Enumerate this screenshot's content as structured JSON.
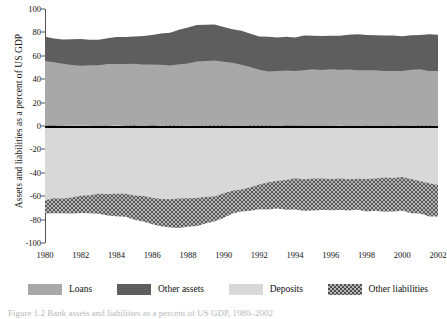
{
  "figure": {
    "caption": "Figure 1.2  Bank assets and liabilities as a percent of US GDP, 1980–2002"
  },
  "axes": {
    "ylabel": "Assets and liabilities as a percent of US GDP",
    "yticks": [
      100,
      80,
      60,
      40,
      20,
      0,
      -20,
      -40,
      -60,
      -80,
      -100
    ],
    "ytick_labels": [
      "100",
      "80",
      "60",
      "40",
      "20",
      "0",
      "-20",
      "-40",
      "-60",
      "-80",
      "-100"
    ],
    "xticks": [
      1980,
      1982,
      1984,
      1986,
      1988,
      1990,
      1992,
      1994,
      1996,
      1998,
      2000,
      2002
    ],
    "xtick_labels": [
      "1980",
      "1982",
      "1984",
      "1986",
      "1988",
      "1990",
      "1992",
      "1994",
      "1996",
      "1998",
      "2000",
      "2002"
    ]
  },
  "legend": [
    {
      "label": "Loans",
      "key": "loans",
      "color": "#a8a8a8",
      "pattern": "solid"
    },
    {
      "label": "Other assets",
      "key": "other_assets",
      "color": "#5e5e5e",
      "pattern": "solid"
    },
    {
      "label": "Deposits",
      "key": "deposits",
      "color": "#d8d8d8",
      "pattern": "solid"
    },
    {
      "label": "Other liabilities",
      "key": "other_liabilities",
      "color": "#9a9a9a",
      "pattern": "dots"
    }
  ],
  "chart_data": {
    "type": "area",
    "title": "",
    "xlabel": "",
    "ylabel": "Assets and liabilities as a percent of US GDP",
    "xlim": [
      1980,
      2002
    ],
    "ylim": [
      -100,
      100
    ],
    "grid": false,
    "legend_position": "bottom",
    "stacked": true,
    "note": "Assets plotted as positive stacked areas (Loans then Other assets); liabilities plotted as negative stacked areas (Deposits then Other liabilities).",
    "x": [
      1980,
      1980.5,
      1981,
      1981.5,
      1982,
      1982.5,
      1983,
      1983.5,
      1984,
      1984.5,
      1985,
      1985.5,
      1986,
      1986.5,
      1987,
      1987.5,
      1988,
      1988.5,
      1989,
      1989.5,
      1990,
      1990.5,
      1991,
      1991.5,
      1992,
      1992.5,
      1993,
      1993.5,
      1994,
      1994.5,
      1995,
      1995.5,
      1996,
      1996.5,
      1997,
      1997.5,
      1998,
      1998.5,
      1999,
      1999.5,
      2000,
      2000.5,
      2001,
      2001.5,
      2002
    ],
    "series": [
      {
        "name": "Loans",
        "color": "#a8a8a8",
        "values": [
          55,
          54,
          53,
          52,
          52,
          52,
          52,
          53,
          53,
          53,
          53,
          53,
          53,
          52,
          52,
          53,
          54,
          55,
          56,
          56,
          55,
          54,
          52,
          50,
          48,
          47,
          47,
          47,
          47,
          48,
          48,
          48,
          48,
          48,
          48,
          48,
          48,
          48,
          47,
          47,
          47,
          48,
          48,
          47,
          47
        ]
      },
      {
        "name": "Other assets",
        "color": "#5e5e5e",
        "values": [
          21,
          21,
          21,
          22,
          22,
          22,
          22,
          22,
          23,
          23,
          23,
          24,
          25,
          27,
          28,
          29,
          30,
          31,
          31,
          31,
          30,
          29,
          29,
          29,
          29,
          29,
          29,
          29,
          29,
          29,
          29,
          29,
          29,
          29,
          30,
          30,
          30,
          30,
          30,
          30,
          30,
          30,
          30,
          31,
          31
        ]
      }
    ],
    "liability_series": [
      {
        "name": "Deposits",
        "color": "#d8d8d8",
        "values": [
          -63,
          -62,
          -62,
          -61,
          -60,
          -59,
          -58,
          -58,
          -58,
          -58,
          -59,
          -60,
          -61,
          -62,
          -62,
          -62,
          -62,
          -62,
          -61,
          -60,
          -58,
          -56,
          -54,
          -52,
          -50,
          -48,
          -47,
          -46,
          -45,
          -45,
          -45,
          -45,
          -45,
          -45,
          -45,
          -45,
          -45,
          -45,
          -44,
          -44,
          -44,
          -45,
          -47,
          -49,
          -50
        ]
      },
      {
        "name": "Other liabilities",
        "color": "#9a9a9a",
        "values": [
          -12,
          -12,
          -13,
          -14,
          -15,
          -16,
          -17,
          -18,
          -19,
          -20,
          -21,
          -22,
          -23,
          -24,
          -25,
          -25,
          -24,
          -23,
          -22,
          -21,
          -20,
          -19,
          -19,
          -20,
          -21,
          -23,
          -24,
          -25,
          -26,
          -27,
          -27,
          -27,
          -27,
          -27,
          -27,
          -27,
          -28,
          -28,
          -29,
          -29,
          -29,
          -29,
          -28,
          -28,
          -27
        ]
      }
    ]
  }
}
